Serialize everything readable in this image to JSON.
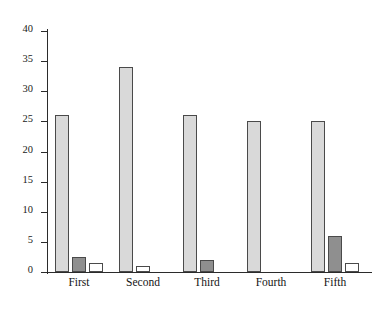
{
  "chart_data": {
    "type": "bar",
    "title": "",
    "subtitle": "",
    "xlabel": "",
    "ylabel": "",
    "categories": [
      "First",
      "Second",
      "Third",
      "Fourth",
      "Fifth"
    ],
    "series": [
      {
        "name": "Series 1",
        "color": "#d9d9d9",
        "values": [
          26,
          34,
          26,
          25,
          25
        ]
      },
      {
        "name": "Series 2",
        "color": "#8f8f8f",
        "values": [
          2.5,
          0,
          2,
          0,
          6
        ]
      },
      {
        "name": "Series 3",
        "color": "#ffffff",
        "values": [
          1.5,
          1,
          0,
          0,
          1.5
        ]
      }
    ],
    "ylim": [
      0,
      40
    ],
    "yticks": [
      0,
      5,
      10,
      15,
      20,
      25,
      30,
      35,
      40
    ],
    "ytick_labels": [
      "0",
      "5",
      "10",
      "15",
      "20",
      "25",
      "30",
      "35",
      "40"
    ],
    "grid": false,
    "legend": "none",
    "axis_color": "#2b2b2b",
    "bar_outline_color": "#4a4a4a",
    "background": "#ffffff"
  }
}
